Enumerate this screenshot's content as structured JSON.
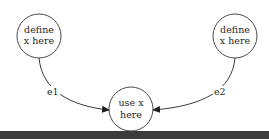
{
  "diagram": {
    "type": "directed-graph",
    "nodes": [
      {
        "id": "def1",
        "line1": "define",
        "line2": "x here"
      },
      {
        "id": "def2",
        "line1": "define",
        "line2": "x here"
      },
      {
        "id": "use",
        "line1": "use x",
        "line2": "here"
      }
    ],
    "edges": [
      {
        "from": "def1",
        "to": "use",
        "label": "e1"
      },
      {
        "from": "def2",
        "to": "use",
        "label": "e2"
      }
    ],
    "colors": {
      "stroke": "#3a3a3a",
      "text": "#2a2a2a",
      "background": "#ffffff"
    }
  }
}
